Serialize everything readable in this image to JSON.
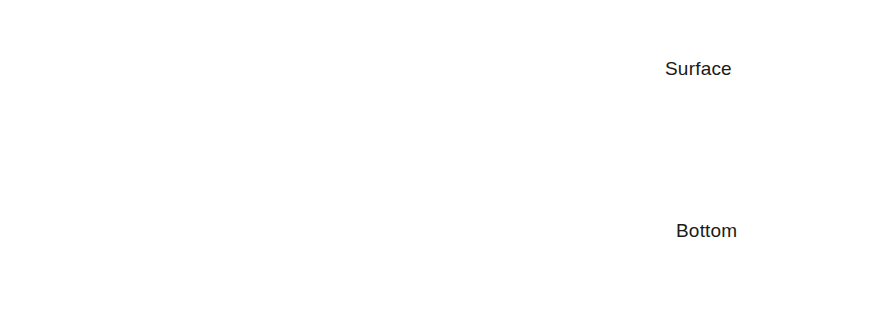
{
  "figure": {
    "labels": {
      "surface": "Surface",
      "bottom": "Bottom"
    },
    "label_positions": {
      "surface": {
        "x": 665,
        "y": 58
      },
      "bottom": {
        "x": 676,
        "y": 220
      }
    }
  },
  "colors": {
    "water_fill": "#b0b0b0",
    "ink": "#1a1a1a",
    "orbit_stroke": "#262626",
    "seabed_base": "#ffffff",
    "seabed_speckle": "#1a1a1a",
    "background": "#ffffff"
  },
  "geometry": {
    "width": 875,
    "height": 319,
    "water_left": 22,
    "water_right": 866,
    "seabed_line_y": 256,
    "seabed_bottom_y": 306,
    "surface_profile": [
      {
        "x": 22,
        "y": 108
      },
      {
        "x": 110,
        "y": 104
      },
      {
        "x": 200,
        "y": 92
      },
      {
        "x": 280,
        "y": 66
      },
      {
        "x": 360,
        "y": 46
      },
      {
        "x": 437,
        "y": 39
      },
      {
        "x": 510,
        "y": 46
      },
      {
        "x": 580,
        "y": 60
      },
      {
        "x": 650,
        "y": 80
      },
      {
        "x": 715,
        "y": 97
      },
      {
        "x": 780,
        "y": 105
      },
      {
        "x": 866,
        "y": 96
      }
    ]
  },
  "orbit_rows": [
    {
      "name": "surface-orbits",
      "depth": "near-surface",
      "shape": "circle",
      "rx": 48,
      "ry": 41,
      "orbits": [
        {
          "cx": 78,
          "cy": 72,
          "phase": "bottom",
          "particle": {
            "x": 78,
            "y": 112
          },
          "arrow": "left-straight"
        },
        {
          "cx": 252,
          "cy": 73,
          "phase": "right",
          "particle": {
            "x": 303,
            "y": 64
          },
          "arrow": "curve-down-right"
        },
        {
          "cx": 437,
          "cy": 72,
          "phase": "top",
          "particle": {
            "x": 437,
            "y": 33
          },
          "arrow": "right-straight"
        },
        {
          "cx": 622,
          "cy": 78,
          "phase": "left",
          "particle": {
            "x": 571,
            "y": 66
          },
          "arrow": "curve-up-right"
        },
        {
          "cx": 804,
          "cy": 73,
          "phase": "bottom",
          "particle": {
            "x": 805,
            "y": 112
          },
          "arrow": "left-straight"
        }
      ]
    },
    {
      "name": "mid-depth-orbits",
      "depth": "mid-depth",
      "shape": "ellipse",
      "rx": 57,
      "ry": 20,
      "orbits": [
        {
          "cx": 76,
          "cy": 163,
          "phase": "bottom",
          "particle": {
            "x": 78,
            "y": 183
          },
          "arrow": "left-straight"
        },
        {
          "cx": 253,
          "cy": 162,
          "phase": "right",
          "particle": {
            "x": 308,
            "y": 156
          },
          "arrow": "curve-down-right"
        },
        {
          "cx": 437,
          "cy": 163,
          "phase": "top",
          "particle": {
            "x": 437,
            "y": 144
          },
          "arrow": "right-straight"
        },
        {
          "cx": 627,
          "cy": 163,
          "phase": "left",
          "particle": {
            "x": 573,
            "y": 157
          },
          "arrow": "curve-up-right"
        },
        {
          "cx": 806,
          "cy": 163,
          "phase": "bottom",
          "particle": {
            "x": 804,
            "y": 184
          },
          "arrow": "left-straight"
        }
      ]
    },
    {
      "name": "bottom-orbits",
      "depth": "seabed",
      "shape": "line",
      "rx": 58,
      "ry": 0,
      "orbits": [
        {
          "cx": 76,
          "cy": 236,
          "phase": "left-moving",
          "particle": {
            "x": 78,
            "y": 236
          },
          "arrow": "left-straight"
        },
        {
          "cx": 252,
          "cy": 236,
          "phase": "right-moving",
          "particle": {
            "x": 305,
            "y": 236
          },
          "arrow": "right-straight"
        },
        {
          "cx": 437,
          "cy": 236,
          "phase": "right-moving",
          "particle": {
            "x": 440,
            "y": 236
          },
          "arrow": "right-straight"
        },
        {
          "cx": 624,
          "cy": 236,
          "phase": "right-moving",
          "particle": {
            "x": 573,
            "y": 236
          },
          "arrow": "right-straight"
        },
        {
          "cx": 806,
          "cy": 236,
          "phase": "left-moving",
          "particle": {
            "x": 805,
            "y": 236
          },
          "arrow": "left-straight"
        }
      ]
    }
  ]
}
